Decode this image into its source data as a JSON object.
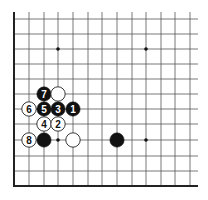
{
  "diagram": {
    "type": "go-board-fragment",
    "colors": {
      "background": "#ffffff",
      "grid": "#555555",
      "edge": "#222222",
      "black_stone": "#111111",
      "white_stone": "#ffffff",
      "stone_outline": "#222222"
    },
    "grid": {
      "left_edge_x": 14,
      "bottom_edge_y": 186,
      "top_y": 12,
      "right_x": 198,
      "col_x": [
        14,
        29,
        44,
        58,
        73,
        88,
        102,
        117,
        132,
        146,
        161,
        175,
        190
      ],
      "row_y": [
        19,
        34,
        49,
        64,
        79,
        94,
        109,
        124,
        140,
        156,
        171
      ]
    },
    "star_points": [
      {
        "col": 3,
        "row": 2
      },
      {
        "col": 9,
        "row": 2
      },
      {
        "col": 3,
        "row": 8
      },
      {
        "col": 9,
        "row": 8
      }
    ],
    "stones": [
      {
        "color": "black",
        "col": 2,
        "row": 5,
        "label": "7"
      },
      {
        "color": "white",
        "col": 3,
        "row": 5,
        "label": ""
      },
      {
        "color": "white",
        "col": 1,
        "row": 6,
        "label": "6"
      },
      {
        "color": "black",
        "col": 2,
        "row": 6,
        "label": "5"
      },
      {
        "color": "black",
        "col": 3,
        "row": 6,
        "label": "3"
      },
      {
        "color": "black",
        "col": 4,
        "row": 6,
        "label": "1"
      },
      {
        "color": "white",
        "col": 2,
        "row": 7,
        "label": "4"
      },
      {
        "color": "white",
        "col": 3,
        "row": 7,
        "label": "2"
      },
      {
        "color": "white",
        "col": 1,
        "row": 8,
        "label": "8"
      },
      {
        "color": "black",
        "col": 2,
        "row": 8,
        "label": ""
      },
      {
        "color": "white",
        "col": 4,
        "row": 8,
        "label": ""
      },
      {
        "color": "black",
        "col": 7,
        "row": 8,
        "label": ""
      }
    ]
  }
}
